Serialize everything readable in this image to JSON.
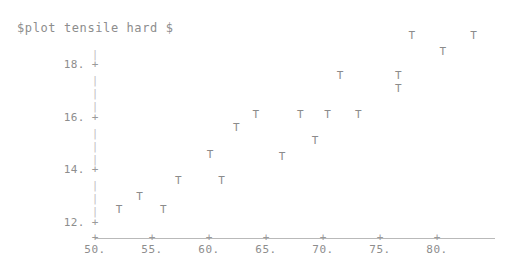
{
  "title": "$plot tensile hard $",
  "marker_glyph": "T",
  "axis": {
    "x_tick_glyph": "+",
    "y_tick_glyph": "+",
    "y_stem_glyph": "|",
    "x_tick_labels": [
      "50.",
      "55.",
      "60.",
      "65.",
      "70.",
      "75.",
      "80."
    ],
    "y_tick_labels": [
      "18.",
      "16.",
      "14.",
      "12."
    ]
  },
  "colors": {
    "background": "#ffffff",
    "text": "#8d8d8d",
    "axis": "#b9b9b9",
    "marker": "#8b8b8b"
  },
  "chart_data": {
    "type": "scatter",
    "title": "$plot tensile hard $",
    "xlabel": "",
    "ylabel": "",
    "xlim": [
      50,
      85
    ],
    "ylim": [
      11.6,
      19.6
    ],
    "grid": false,
    "legend": null,
    "marker": "T",
    "xticks": [
      50,
      55,
      60,
      65,
      70,
      75,
      80
    ],
    "yticks": [
      12,
      14,
      16,
      18
    ],
    "xticklabels": [
      "50.",
      "55.",
      "60.",
      "65.",
      "70.",
      "75.",
      "80."
    ],
    "yticklabels": [
      "12.",
      "14.",
      "16.",
      "18."
    ],
    "series": [
      {
        "name": "tensile vs hard",
        "points": [
          [
            52.1,
            12.5
          ],
          [
            53.9,
            13.0
          ],
          [
            56.0,
            12.5
          ],
          [
            57.3,
            13.6
          ],
          [
            60.1,
            14.6
          ],
          [
            61.1,
            13.6
          ],
          [
            62.4,
            15.6
          ],
          [
            64.1,
            16.1
          ],
          [
            66.4,
            14.5
          ],
          [
            68.0,
            16.1
          ],
          [
            69.3,
            15.1
          ],
          [
            70.4,
            16.1
          ],
          [
            71.5,
            17.6
          ],
          [
            73.1,
            16.1
          ],
          [
            76.6,
            17.1
          ],
          [
            76.6,
            17.6
          ],
          [
            77.8,
            19.1
          ],
          [
            80.5,
            18.5
          ],
          [
            83.2,
            19.1
          ]
        ]
      }
    ]
  }
}
